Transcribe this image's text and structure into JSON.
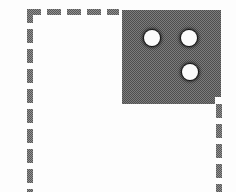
{
  "figure": {
    "canvas": {
      "width": 236,
      "height": 192
    },
    "colors": {
      "background": "#fdfdfd",
      "ink": "#575757",
      "plate_fill": "#4e4e4e",
      "hole_fill": "#fbfbfb",
      "hole_outline": "#141414"
    }
  },
  "dashed_frame": {
    "name": "dashed-boundary",
    "stroke_width": 6,
    "dash_length": 14,
    "dash_gap": 6,
    "top_edge": {
      "y": 9,
      "x_start": 27,
      "x_end": 119,
      "orientation": "horizontal"
    },
    "left_edge": {
      "x": 27,
      "y_start": 9,
      "y_end": 192,
      "orientation": "vertical"
    },
    "right_edge": {
      "x": 216,
      "y_start": 104,
      "y_end": 192,
      "orientation": "vertical"
    },
    "top_dashes_x": [
      27,
      47,
      67,
      87,
      107
    ],
    "left_dashes_y": [
      9,
      29,
      49,
      69,
      89,
      109,
      129,
      149,
      169,
      189
    ],
    "right_dashes_y": [
      104,
      124,
      144,
      164,
      184
    ]
  },
  "plate": {
    "name": "three-hole-plate",
    "x": 122,
    "y": 10,
    "width": 99,
    "height": 94,
    "notch": {
      "x": 215,
      "y": 97,
      "width": 6,
      "height": 7
    },
    "holes": [
      {
        "label": "hole-top-left",
        "cx": 152,
        "cy": 38,
        "r": 8
      },
      {
        "label": "hole-top-right",
        "cx": 189,
        "cy": 38,
        "r": 8
      },
      {
        "label": "hole-bottom-right",
        "cx": 190,
        "cy": 72,
        "r": 8
      }
    ]
  }
}
